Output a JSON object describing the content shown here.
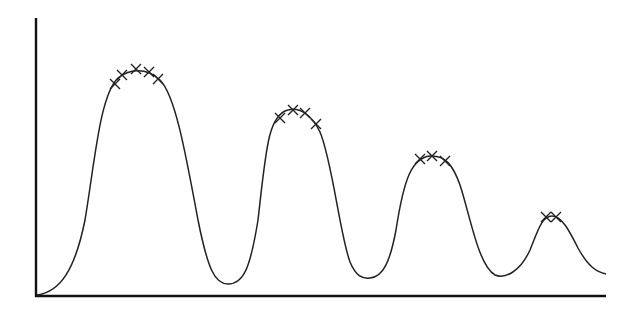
{
  "chart_data": {
    "type": "line",
    "title": "",
    "xlabel": "",
    "ylabel": "",
    "grid": false,
    "legend": null,
    "axis_ranges": {
      "x": [
        0,
        100
      ],
      "y": [
        0,
        100
      ]
    },
    "curve_points": [
      [
        0,
        0
      ],
      [
        5,
        6
      ],
      [
        8,
        22
      ],
      [
        11,
        60
      ],
      [
        14,
        74
      ],
      [
        17,
        81
      ],
      [
        20,
        80
      ],
      [
        23,
        74
      ],
      [
        26,
        52
      ],
      [
        29,
        18
      ],
      [
        32,
        4
      ],
      [
        34,
        5
      ],
      [
        38,
        30
      ],
      [
        40,
        61
      ],
      [
        43,
        67
      ],
      [
        46,
        64
      ],
      [
        49,
        42
      ],
      [
        52,
        12
      ],
      [
        55,
        7
      ],
      [
        58,
        15
      ],
      [
        61,
        46
      ],
      [
        64,
        50
      ],
      [
        67,
        46
      ],
      [
        70,
        20
      ],
      [
        75,
        7
      ],
      [
        79,
        9
      ],
      [
        84,
        25
      ],
      [
        86,
        28
      ],
      [
        89,
        26
      ],
      [
        93,
        13
      ],
      [
        100,
        8
      ]
    ],
    "peaks": [
      {
        "index": 1,
        "x": 17,
        "y": 81,
        "marker_count": 5
      },
      {
        "index": 2,
        "x": 45,
        "y": 67,
        "marker_count": 4
      },
      {
        "index": 3,
        "x": 69,
        "y": 50,
        "marker_count": 3
      },
      {
        "index": 4,
        "x": 91,
        "y": 28,
        "marker_count": 2
      }
    ],
    "series": [
      {
        "name": "signal",
        "color": "#222222",
        "style": "solid"
      },
      {
        "name": "peak-markers",
        "marker": "x",
        "color": "#222222",
        "points": [
          [
            115,
            84
          ],
          [
            122,
            75
          ],
          [
            136,
            69
          ],
          [
            149,
            72
          ],
          [
            158,
            79
          ],
          [
            280,
            118
          ],
          [
            293,
            110
          ],
          [
            305,
            113
          ],
          [
            316,
            124
          ],
          [
            420,
            159
          ],
          [
            432,
            156
          ],
          [
            445,
            161
          ],
          [
            546,
            217
          ],
          [
            556,
            217
          ]
        ]
      }
    ]
  },
  "colors": {
    "line": "#222222",
    "axis": "#111111",
    "background": "#ffffff"
  }
}
